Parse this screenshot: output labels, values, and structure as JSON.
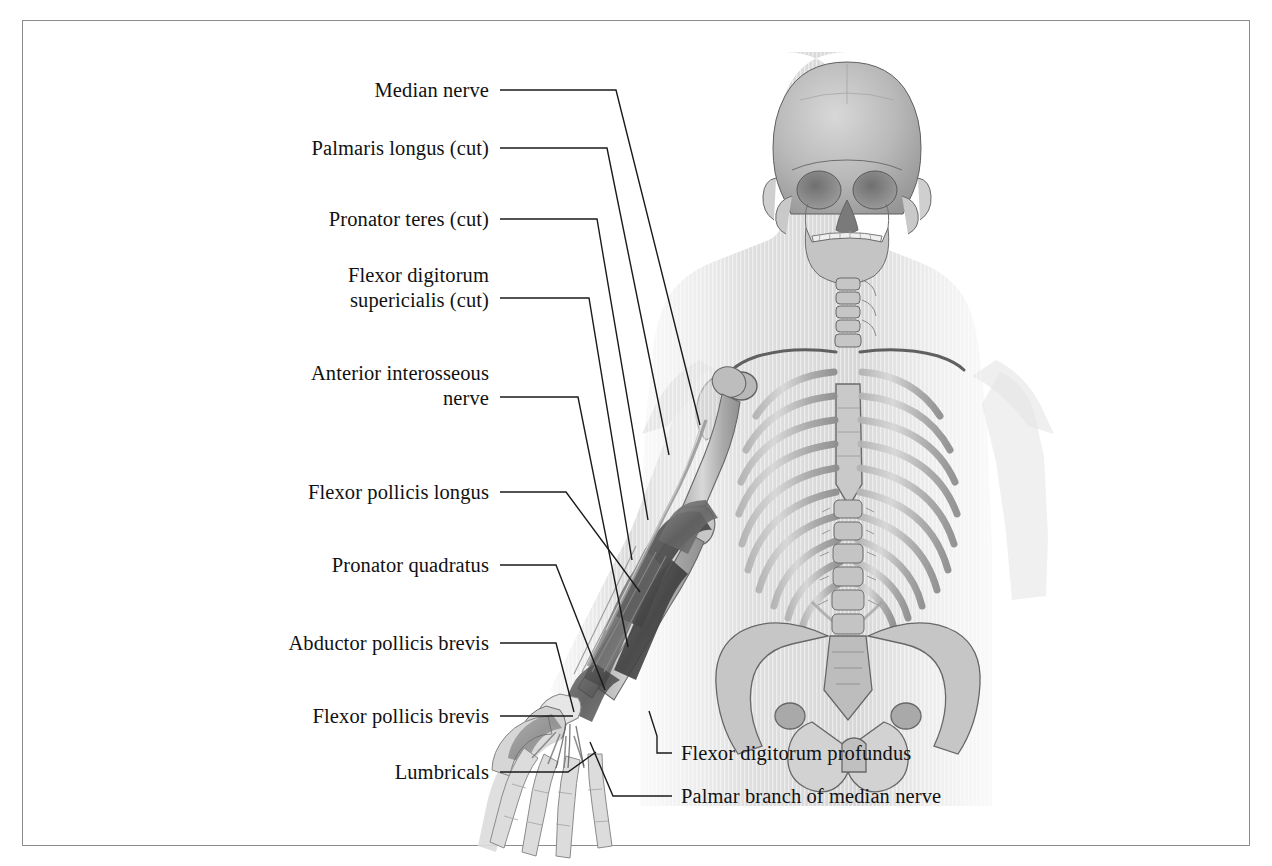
{
  "figure": {
    "kind": "anatomical-illustration",
    "view": "anterior",
    "style": "grayscale pencil-shaded medical illustration with translucent body silhouette",
    "frame_color": "#8c8c8c",
    "background_color": "#ffffff",
    "ink_color": "#111111"
  },
  "labels_left": [
    {
      "text": "Median nerve",
      "x": 489,
      "y": 90
    },
    {
      "text": "Palmaris longus (cut)",
      "x": 489,
      "y": 148
    },
    {
      "text": "Pronator teres (cut)",
      "x": 489,
      "y": 219
    },
    {
      "text": "Flexor digitorum\nsupericialis (cut)",
      "x": 489,
      "y": 287
    },
    {
      "text": "Anterior interosseous\nnerve",
      "x": 489,
      "y": 385
    },
    {
      "text": "Flexor pollicis longus",
      "x": 489,
      "y": 492
    },
    {
      "text": "Pronator quadratus",
      "x": 489,
      "y": 565
    },
    {
      "text": "Abductor pollicis brevis",
      "x": 489,
      "y": 643
    },
    {
      "text": "Flexor pollicis brevis",
      "x": 489,
      "y": 716
    },
    {
      "text": "Lumbricals",
      "x": 489,
      "y": 772
    }
  ],
  "labels_right": [
    {
      "text": "Flexor digitorum profundus",
      "x": 681,
      "y": 753
    },
    {
      "text": "Palmar branch of median nerve",
      "x": 681,
      "y": 796
    }
  ],
  "anatomy": {
    "skeleton_parts": [
      "skull",
      "mandible",
      "cervical spine",
      "clavicle",
      "scapula",
      "humerus",
      "ribcage",
      "sternum",
      "lumbar spine",
      "pelvis",
      "sacrum",
      "radius",
      "ulna",
      "carpals",
      "metacarpals",
      "phalanges"
    ],
    "dissected_structures": [
      "flexor muscle bellies of forearm",
      "median nerve",
      "flexor retinaculum",
      "thenar muscles",
      "lumbricals",
      "digital nerves"
    ]
  }
}
